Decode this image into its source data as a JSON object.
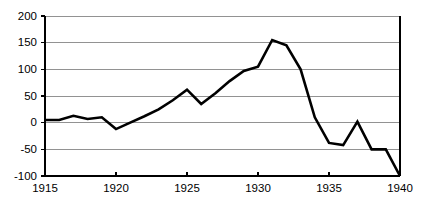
{
  "chart_data": {
    "type": "line",
    "title": "",
    "subtitle": "",
    "xlabel": "",
    "ylabel": "",
    "xlim": [
      1915,
      1940
    ],
    "ylim": [
      -100,
      200
    ],
    "grid": true,
    "legend": false,
    "legend_position": "none",
    "line_color": "#000000",
    "grid_color": "#868686",
    "axis_color": "#000000",
    "background_color": "#ffffff",
    "y_ticks": [
      200,
      150,
      100,
      50,
      0,
      -50,
      -100
    ],
    "y_tick_labels": [
      "200",
      "150",
      "100",
      "50",
      "0",
      "-50",
      "-100"
    ],
    "x_ticks": [
      1915,
      1920,
      1925,
      1930,
      1935,
      1940
    ],
    "x_tick_labels": [
      "1915",
      "1920",
      "1925",
      "1930",
      "1935",
      "1940"
    ],
    "x": [
      1915,
      1916,
      1917,
      1918,
      1919,
      1920,
      1921,
      1922,
      1923,
      1924,
      1925,
      1926,
      1927,
      1928,
      1929,
      1930,
      1931,
      1932,
      1933,
      1934,
      1935,
      1936,
      1937,
      1938,
      1939,
      1940
    ],
    "values": [
      5,
      5,
      13,
      7,
      10,
      -12,
      0,
      12,
      25,
      42,
      62,
      35,
      55,
      78,
      97,
      105,
      155,
      145,
      100,
      10,
      -38,
      -42,
      2,
      -50,
      -50,
      -100
    ],
    "series": [
      {
        "name": "series-1",
        "values": [
          5,
          5,
          13,
          7,
          10,
          -12,
          0,
          12,
          25,
          42,
          62,
          35,
          55,
          78,
          97,
          105,
          155,
          145,
          100,
          10,
          -38,
          -42,
          2,
          -50,
          -50,
          -100
        ]
      }
    ]
  }
}
